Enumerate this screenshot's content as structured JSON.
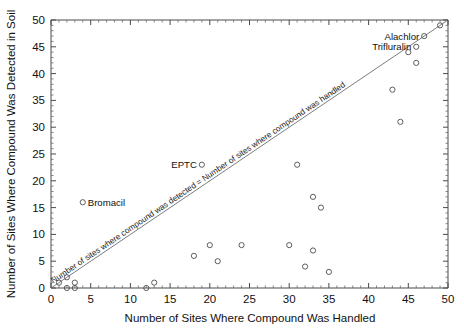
{
  "chart_data": {
    "type": "scatter",
    "title": "",
    "xlabel": "Number of Sites Where Compound Was Handled",
    "ylabel": "Number of Sites Where Compound Was Detected in Soil",
    "xlim": [
      0,
      50
    ],
    "ylim": [
      0,
      50
    ],
    "xticks": [
      0,
      5,
      10,
      15,
      20,
      25,
      30,
      35,
      40,
      45,
      50
    ],
    "yticks": [
      0,
      5,
      10,
      15,
      20,
      25,
      30,
      35,
      40,
      45,
      50
    ],
    "xticklabels": [
      "0",
      "5",
      "10",
      "15",
      "20",
      "25",
      "30",
      "35",
      "40",
      "45",
      "50"
    ],
    "yticklabels": [
      "0",
      "5",
      "10",
      "15",
      "20",
      "25",
      "30",
      "35",
      "40",
      "45",
      "50"
    ],
    "grid": false,
    "legend": "none",
    "minor_ticks": true,
    "reference_line": {
      "type": "identity",
      "from": [
        0,
        0
      ],
      "to": [
        50,
        50
      ],
      "label": "Number of sites where compound was detected = Number of sites where compound was handled"
    },
    "points": [
      {
        "x": 1,
        "y": 1
      },
      {
        "x": 2,
        "y": 2
      },
      {
        "x": 2,
        "y": 0
      },
      {
        "x": 3,
        "y": 0
      },
      {
        "x": 3,
        "y": 1
      },
      {
        "x": 4,
        "y": 16,
        "label": "Bromacil"
      },
      {
        "x": 12,
        "y": 0
      },
      {
        "x": 13,
        "y": 1
      },
      {
        "x": 18,
        "y": 6
      },
      {
        "x": 19,
        "y": 23,
        "label": "EPTC"
      },
      {
        "x": 20,
        "y": 8
      },
      {
        "x": 21,
        "y": 5
      },
      {
        "x": 24,
        "y": 8
      },
      {
        "x": 30,
        "y": 8
      },
      {
        "x": 31,
        "y": 23
      },
      {
        "x": 32,
        "y": 4
      },
      {
        "x": 33,
        "y": 17
      },
      {
        "x": 33,
        "y": 7
      },
      {
        "x": 34,
        "y": 15
      },
      {
        "x": 35,
        "y": 3
      },
      {
        "x": 43,
        "y": 37
      },
      {
        "x": 44,
        "y": 31
      },
      {
        "x": 45,
        "y": 44
      },
      {
        "x": 46,
        "y": 45,
        "label": "Trifluralin"
      },
      {
        "x": 46,
        "y": 42
      },
      {
        "x": 47,
        "y": 47,
        "label": "Alachlor"
      },
      {
        "x": 49,
        "y": 49
      }
    ],
    "annotations": [
      {
        "text": "Alachlor",
        "point_x": 47,
        "point_y": 47,
        "anchor": "end"
      },
      {
        "text": "Trifluralin",
        "point_x": 46,
        "point_y": 45,
        "anchor": "end"
      },
      {
        "text": "EPTC",
        "point_x": 19,
        "point_y": 23,
        "anchor": "end"
      },
      {
        "text": "Bromacil",
        "point_x": 4,
        "point_y": 16,
        "anchor": "start"
      }
    ],
    "colors": {
      "marker_stroke": "#4d4d4d",
      "axis": "#4a4a4a",
      "text": "#111111",
      "background": "#ffffff"
    }
  }
}
